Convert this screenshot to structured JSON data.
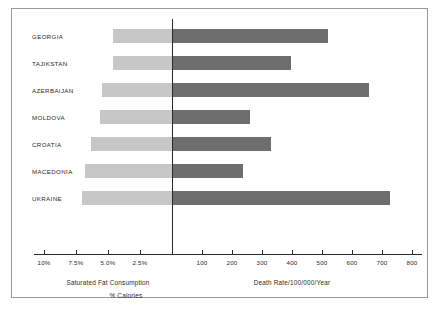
{
  "chart_data": {
    "type": "bar",
    "title": "",
    "subtitle": "",
    "orientation": "horizontal",
    "style": "diverging-bidirectional",
    "categories": [
      "GEORGIA",
      "TAJIKSTAN",
      "AZERBAIJAN",
      "MOLDOVA",
      "CROATIA",
      "MACEDONIA",
      "UKRAINE"
    ],
    "series": [
      {
        "name": "Saturated Fat Consumption",
        "unit": "% Calories",
        "side": "left",
        "color": "#c7c7c7",
        "axis_label": "Saturated Fat Consumption",
        "axis_sublabel": "% Calories",
        "axis_ticks": [
          "10%",
          "7.5%",
          "5.0%",
          "2.5%"
        ],
        "axis_tick_values": [
          10,
          7.5,
          5.0,
          2.5
        ],
        "axis_min": 0,
        "axis_max": 10,
        "values": [
          4.6,
          4.6,
          5.5,
          5.6,
          6.3,
          6.8,
          7.0
        ]
      },
      {
        "name": "Death Rate/100/000/Year",
        "unit": "per 100,000 per year",
        "side": "right",
        "color": "#6e6e6e",
        "axis_label": "Death Rate/100/000/Year",
        "axis_sublabel": "",
        "axis_ticks": [
          "100",
          "200",
          "300",
          "400",
          "500",
          "600",
          "700",
          "800"
        ],
        "axis_tick_values": [
          100,
          200,
          300,
          400,
          500,
          600,
          700,
          800
        ],
        "axis_min": 0,
        "axis_max": 800,
        "values": [
          520,
          395,
          655,
          260,
          330,
          235,
          725
        ]
      }
    ],
    "grid": false,
    "legend": "none",
    "annotations": []
  },
  "figure": {
    "border_color": "#9a9a9a",
    "background": "#ffffff",
    "zero_line_color": "#2b2b2b"
  }
}
